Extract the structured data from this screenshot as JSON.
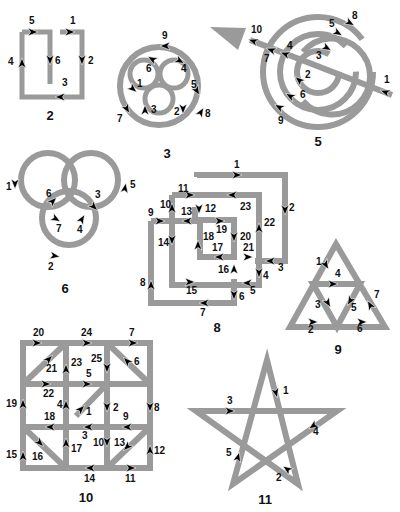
{
  "figures": [
    {
      "id": "2",
      "caption": "2",
      "step_labels": [
        "1",
        "2",
        "3",
        "4",
        "5",
        "6"
      ]
    },
    {
      "id": "3",
      "caption": "3",
      "step_labels": [
        "1",
        "2",
        "3",
        "4",
        "5",
        "6",
        "7",
        "8",
        "9"
      ]
    },
    {
      "id": "5",
      "caption": "5",
      "step_labels": [
        "1",
        "2",
        "3",
        "4",
        "5",
        "6",
        "7",
        "8",
        "9",
        "10"
      ]
    },
    {
      "id": "6",
      "caption": "6",
      "step_labels": [
        "1",
        "2",
        "3",
        "4",
        "5",
        "6",
        "7"
      ]
    },
    {
      "id": "8",
      "caption": "8",
      "step_labels": [
        "1",
        "2",
        "3",
        "4",
        "5",
        "6",
        "7",
        "8",
        "9",
        "10",
        "11",
        "12",
        "13",
        "14",
        "15",
        "16",
        "17",
        "18",
        "19",
        "20",
        "21",
        "22",
        "23"
      ]
    },
    {
      "id": "9",
      "caption": "9",
      "step_labels": [
        "1",
        "2",
        "3",
        "4",
        "5",
        "6",
        "7"
      ]
    },
    {
      "id": "10",
      "caption": "10",
      "step_labels": [
        "1",
        "2",
        "3",
        "4",
        "5",
        "6",
        "7",
        "8",
        "9",
        "10",
        "11",
        "12",
        "13",
        "14",
        "15",
        "16",
        "17",
        "18",
        "19",
        "20",
        "21",
        "22",
        "23",
        "24",
        "25"
      ]
    },
    {
      "id": "11",
      "caption": "11",
      "step_labels": [
        "1",
        "2",
        "3",
        "4",
        "5"
      ]
    }
  ],
  "colors": {
    "stroke": "#9a9a9a",
    "arrow": "#000000",
    "text": "#111111"
  }
}
